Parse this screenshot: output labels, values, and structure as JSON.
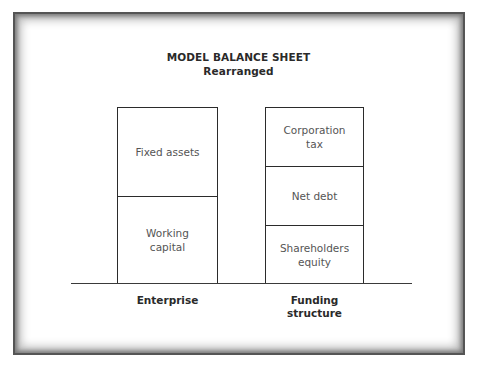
{
  "title": {
    "line1": "MODEL  BALANCE SHEET",
    "line2": "Rearranged"
  },
  "enterprise": {
    "label": "Enterprise",
    "blocks": [
      {
        "line1": "Fixed assets",
        "line2": ""
      },
      {
        "line1": "Working",
        "line2": "capital"
      }
    ]
  },
  "funding": {
    "label_line1": "Funding",
    "label_line2": "structure",
    "blocks": [
      {
        "line1": "Corporation",
        "line2": "tax"
      },
      {
        "line1": "Net debt",
        "line2": ""
      },
      {
        "line1": "Shareholders",
        "line2": "equity"
      }
    ]
  },
  "colors": {
    "line": "#2b2b2b",
    "block_text": "#555555",
    "label_text": "#2a2a2a"
  }
}
